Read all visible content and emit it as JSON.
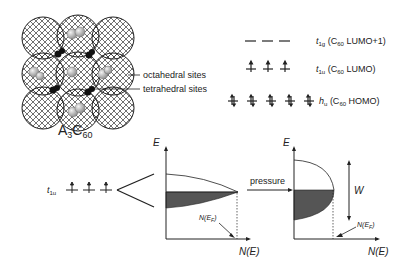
{
  "crystal": {
    "compound": {
      "base": "A",
      "sub1": "3",
      "mid": "C",
      "sub2": "60"
    },
    "annotations": [
      "octahedral sites",
      "tetrahedral sites"
    ]
  },
  "levels": [
    {
      "symbol": "t",
      "sub": "1g",
      "desc": "(C",
      "desc_sub": "60",
      "desc_tail": " LUMO+1)",
      "count": 3,
      "filled": "empty"
    },
    {
      "symbol": "t",
      "sub": "1u",
      "desc": "(C",
      "desc_sub": "60",
      "desc_tail": " LUMO)",
      "count": 3,
      "filled": "up"
    },
    {
      "symbol": "h",
      "sub": "u",
      "desc": "(C",
      "desc_sub": "60",
      "desc_tail": " HOMO)",
      "count": 5,
      "filled": "pair"
    }
  ],
  "band": {
    "t1u_label": {
      "symbol": "t",
      "sub": "1u"
    },
    "arrow_label": "pressure",
    "left_dos": {
      "y_axis": "E",
      "x_axis": "N(E)",
      "fermi_label": {
        "pre": "N(E",
        "sub": "F",
        "post": ")"
      }
    },
    "right_dos": {
      "y_axis": "E",
      "x_axis": "N(E)",
      "width_label": "W",
      "fermi_label": {
        "pre": "N(E",
        "sub": "F",
        "post": ")"
      }
    }
  },
  "colors": {
    "line": "#222222",
    "fill": "#555555",
    "ball": "#bbbbbb"
  }
}
